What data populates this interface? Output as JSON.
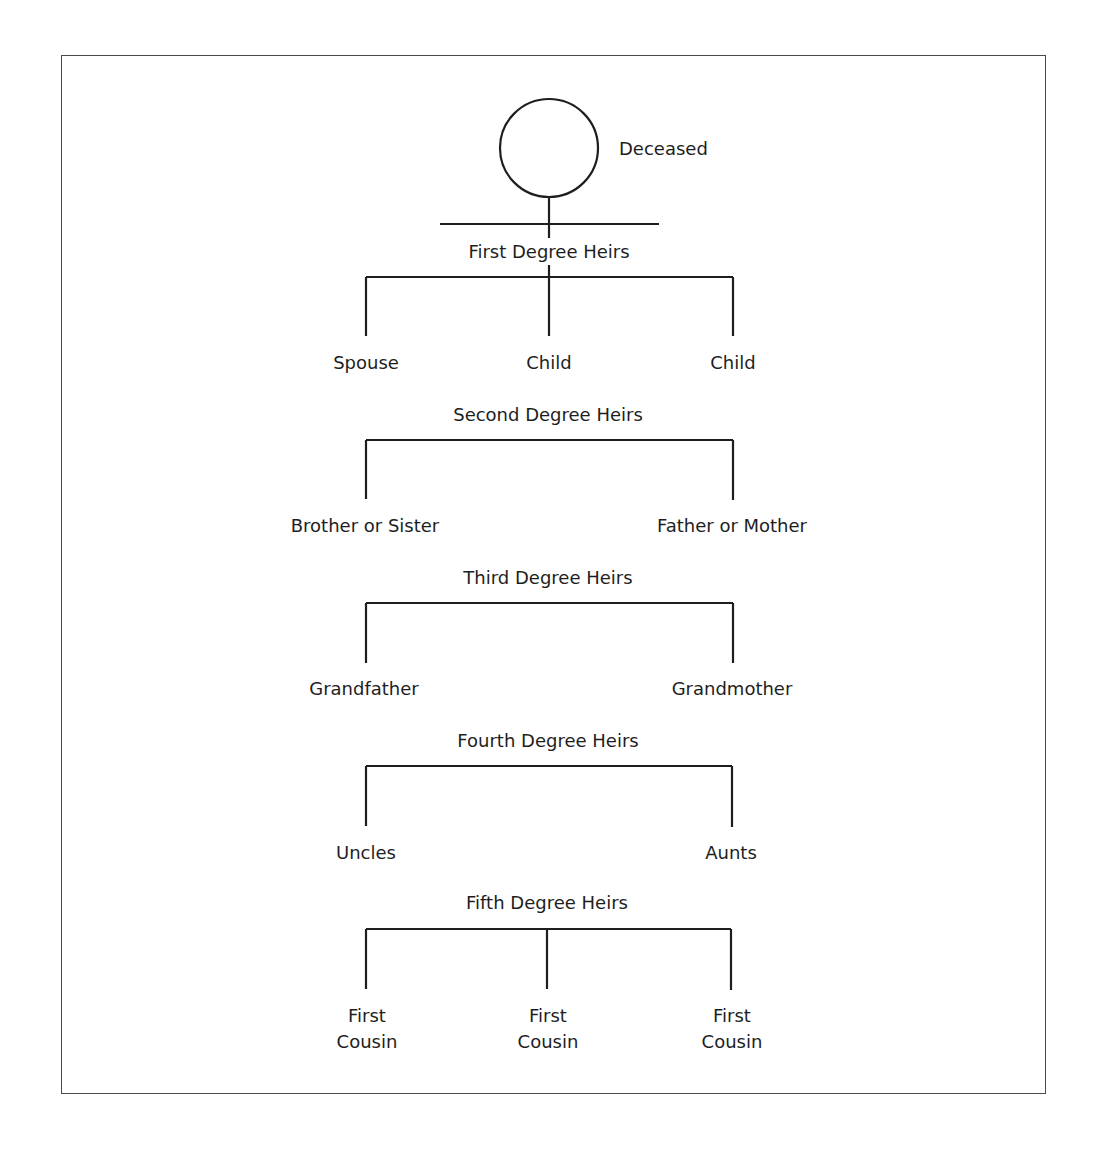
{
  "diagram": {
    "type": "inheritance-degrees-tree",
    "root": {
      "label": "Deceased",
      "shape": "circle"
    },
    "levels": [
      {
        "title": "First Degree Heirs",
        "members": [
          "Spouse",
          "Child",
          "Child"
        ]
      },
      {
        "title": "Second Degree Heirs",
        "members": [
          "Brother or Sister",
          "Father or Mother"
        ]
      },
      {
        "title": "Third Degree Heirs",
        "members": [
          "Grandfather",
          "Grandmother"
        ]
      },
      {
        "title": "Fourth Degree Heirs",
        "members": [
          "Uncles",
          "Aunts"
        ]
      },
      {
        "title": "Fifth Degree Heirs",
        "members": [
          "First\nCousin",
          "First\nCousin",
          "First\nCousin"
        ]
      }
    ],
    "first_cousin_line1": "First",
    "first_cousin_line2": "Cousin",
    "colors": {
      "line": "#1e1e1e",
      "frame": "#4a4a4a",
      "background": "#ffffff"
    }
  }
}
